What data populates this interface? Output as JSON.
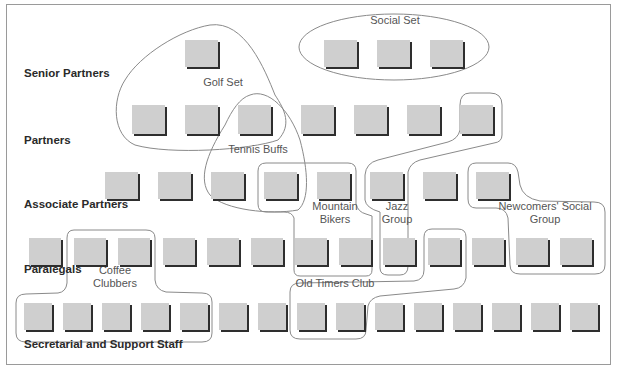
{
  "tiers": [
    {
      "label": "Senior Partners",
      "x": 24,
      "y": 74
    },
    {
      "label": "Partners",
      "x": 24,
      "y": 141
    },
    {
      "label": "Associate Partners",
      "x": 24,
      "y": 205
    },
    {
      "label": "Paralegals",
      "x": 24,
      "y": 270
    },
    {
      "label": "Secretarial and Support Staff",
      "x": 24,
      "y": 345
    }
  ],
  "groups": [
    {
      "label": "Golf Set",
      "x": 183,
      "y": 82,
      "w": 80
    },
    {
      "label": "Social Set",
      "x": 355,
      "y": 20,
      "w": 80
    },
    {
      "label": "Tennis Buffs",
      "x": 213,
      "y": 149,
      "w": 90
    },
    {
      "label": "Mountain Bikers",
      "x": 300,
      "y": 206,
      "w": 70
    },
    {
      "label": "Jazz Group",
      "x": 377,
      "y": 206,
      "w": 40
    },
    {
      "label": "Newcomers' Social Group",
      "x": 490,
      "y": 206,
      "w": 110
    },
    {
      "label": "Coffee Clubbers",
      "x": 80,
      "y": 270,
      "w": 70
    },
    {
      "label": "Old Timers Club",
      "x": 285,
      "y": 283,
      "w": 100
    }
  ],
  "rows": [
    {
      "name": "senior-partners-row",
      "y": 40,
      "h": 27,
      "w": 33,
      "xs": [
        185,
        324,
        377,
        430
      ]
    },
    {
      "name": "partners-row",
      "y": 105,
      "h": 29,
      "w": 33,
      "xs": [
        132,
        185,
        238,
        301,
        354,
        407,
        460
      ]
    },
    {
      "name": "associate-partners-row",
      "y": 172,
      "h": 27,
      "w": 33,
      "xs": [
        105,
        158,
        211,
        264,
        317,
        370,
        423,
        476
      ]
    },
    {
      "name": "paralegals-row",
      "y": 238,
      "h": 27,
      "w": 32,
      "xs": [
        29,
        74,
        118,
        163,
        207,
        251,
        295,
        339,
        383,
        428,
        472,
        516,
        560
      ]
    },
    {
      "name": "support-staff-row",
      "y": 303,
      "h": 27,
      "w": 28,
      "xs": [
        24,
        63,
        102,
        141,
        180,
        219,
        258,
        297,
        336,
        375,
        414,
        453,
        492,
        531,
        570
      ]
    }
  ],
  "colors": {
    "box_fill": "#cfcfcf",
    "box_shadow": "#2e2e2e",
    "outline": "#8a8a8a",
    "frame": "#9a9a9a"
  }
}
